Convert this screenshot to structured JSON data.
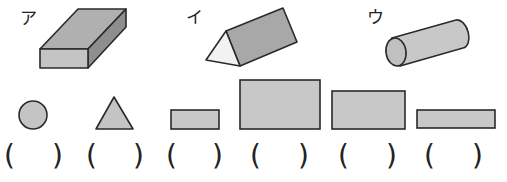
{
  "solids": [
    {
      "label": "ア",
      "shape": "rectangular-prism"
    },
    {
      "label": "イ",
      "shape": "triangular-prism"
    },
    {
      "label": "ウ",
      "shape": "cylinder"
    }
  ],
  "faces": [
    {
      "shape": "circle"
    },
    {
      "shape": "triangle"
    },
    {
      "shape": "small-rectangle"
    },
    {
      "shape": "large-rectangle"
    },
    {
      "shape": "medium-rectangle"
    },
    {
      "shape": "thin-rectangle"
    }
  ],
  "answer_blanks": {
    "open": "(",
    "close": ")",
    "values": [
      "",
      "",
      "",
      "",
      "",
      ""
    ]
  },
  "colors": {
    "fill_main": "#b4b4b4",
    "fill_light": "#d0d0d0",
    "fill_dark": "#8c8c8c",
    "fill_white": "#f4f4f4",
    "stroke": "#2a2a2a"
  }
}
